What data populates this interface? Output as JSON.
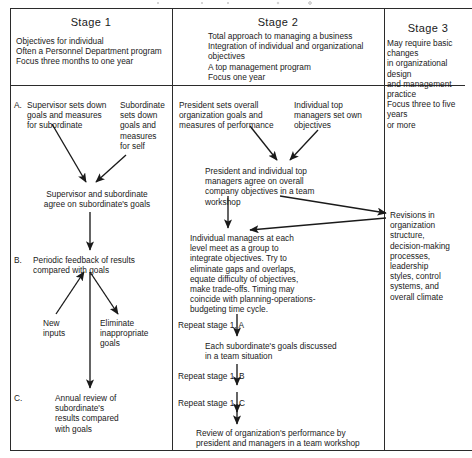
{
  "diagram": {
    "title_cutoff": "",
    "columns": [
      {
        "key": "stage1",
        "header": "Stage 1",
        "summary": "Objectives for individual\nOften a Personnel Department program\nFocus three months to one year"
      },
      {
        "key": "stage2",
        "header": "Stage 2",
        "summary": "Total approach to managing a business\nIntegration of individual and organizational\n    objectives\nA top management program\nFocus one year"
      },
      {
        "key": "stage3",
        "header": "Stage 3",
        "summary": "May require basic changes\n   in organizational design\n   and management\n   practice\nFocus three to five years\nor more"
      }
    ],
    "stage1_nodes": {
      "a_marker": "A.",
      "a_left": "Supervisor sets down\ngoals and measures\nfor subordinate",
      "a_right": "Subordinate\nsets down\ngoals and\nmeasures\nfor self",
      "agree": "Supervisor and subordinate\nagree on subordinate's goals",
      "b_marker": "B.",
      "b_text": "Periodic feedback of results\ncompared with goals",
      "new_inputs": "New\ninputs",
      "eliminate": "Eliminate\ninappropriate\ngoals",
      "c_marker": "C.",
      "c_text": "Annual review of\nsubordinate's\nresults compared\nwith goals"
    },
    "stage2_nodes": {
      "president": "President sets overall\norganization goals and\nmeasures of performance",
      "individual_top": "Individual top\nmanagers set own\nobjectives",
      "agree_team": "President and individual top\nmanagers agree on overall\ncompany objectives in a team\nworkshop",
      "integrate": "Individual managers at each\nlevel meet as a group to\nintegrate objectives.  Try to\neliminate gaps and overlaps,\nequate difficulty of objectives,\nmake trade-offs.  Timing may\ncoincide with planning-operations-\nbudgeting time cycle.",
      "repeat_a": "Repeat stage 1, A",
      "each_sub": "Each subordinate's goals discussed\nin a team situation",
      "repeat_b": "Repeat stage 1, B",
      "repeat_c": "Repeat stage 1, C",
      "review": "Review of organization's performance by\npresident and managers in a team workshop"
    },
    "stage3_nodes": {
      "revisions": "Revisions in\norganization\nstructure,\ndecision-making\nprocesses,\nleadership\nstyles, control\nsystems, and\noverall climate"
    },
    "colors": {
      "ink": "#1a1a1a",
      "rule": "#2b2b2b",
      "paper": "#ffffff"
    }
  }
}
